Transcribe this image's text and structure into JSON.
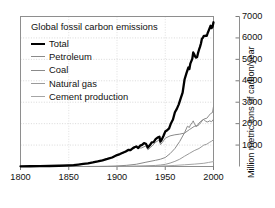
{
  "chart_data": {
    "type": "line",
    "title": "Global fossil carbon emissions",
    "xlabel": "",
    "ylabel": "Million metric tons of carbon/year",
    "xlim": [
      1800,
      2000
    ],
    "ylim": [
      0,
      7000
    ],
    "xticks": [
      1800,
      1850,
      1900,
      1950,
      2000
    ],
    "yticks": [
      1000,
      2000,
      3000,
      4000,
      5000,
      6000,
      7000
    ],
    "grid": true,
    "legend_position": "upper left",
    "legend": [
      "Total",
      "Petroleum",
      "Coal",
      "Natural gas",
      "Cement production"
    ],
    "series": [
      {
        "name": "Total",
        "color": "#000000",
        "width": 2.3,
        "x": [
          1800,
          1810,
          1820,
          1830,
          1840,
          1850,
          1855,
          1860,
          1865,
          1870,
          1875,
          1880,
          1885,
          1890,
          1895,
          1900,
          1903,
          1906,
          1909,
          1912,
          1914,
          1916,
          1918,
          1920,
          1922,
          1924,
          1926,
          1928,
          1930,
          1932,
          1934,
          1936,
          1938,
          1940,
          1942,
          1944,
          1945,
          1946,
          1948,
          1950,
          1952,
          1954,
          1956,
          1958,
          1960,
          1962,
          1964,
          1966,
          1968,
          1970,
          1972,
          1974,
          1975,
          1976,
          1978,
          1979,
          1980,
          1981,
          1982,
          1983,
          1984,
          1985,
          1986,
          1987,
          1988,
          1989,
          1990,
          1991,
          1992,
          1993,
          1994,
          1995,
          1996,
          1997,
          1998,
          1999,
          2000
        ],
        "y": [
          8,
          11,
          17,
          24,
          36,
          54,
          64,
          91,
          119,
          147,
          188,
          236,
          290,
          352,
          420,
          534,
          580,
          640,
          700,
          780,
          760,
          840,
          900,
          935,
          860,
          975,
          1010,
          1090,
          1060,
          880,
          990,
          1130,
          1140,
          1280,
          1350,
          1390,
          1160,
          1220,
          1410,
          1630,
          1690,
          1780,
          2020,
          2190,
          2530,
          2690,
          2900,
          3180,
          3450,
          4060,
          4360,
          4620,
          4550,
          4800,
          5020,
          5320,
          5240,
          5130,
          5080,
          5110,
          5300,
          5450,
          5580,
          5740,
          5960,
          6010,
          6100,
          6090,
          6110,
          6100,
          6230,
          6340,
          6450,
          6570,
          6460,
          6520,
          6730
        ]
      },
      {
        "name": "Petroleum",
        "color": "#8a8a8a",
        "width": 1.0,
        "x": [
          1870,
          1880,
          1890,
          1900,
          1910,
          1920,
          1930,
          1940,
          1945,
          1950,
          1955,
          1960,
          1965,
          1970,
          1973,
          1975,
          1976,
          1978,
          1979,
          1980,
          1982,
          1984,
          1985,
          1987,
          1989,
          1991,
          1993,
          1995,
          1997,
          1999,
          2000
        ],
        "y": [
          1,
          5,
          12,
          25,
          55,
          105,
          200,
          290,
          340,
          420,
          600,
          840,
          1170,
          1580,
          1880,
          1820,
          1930,
          2050,
          2130,
          2020,
          1870,
          1920,
          1950,
          2060,
          2180,
          2230,
          2250,
          2360,
          2470,
          2520,
          2800
        ]
      },
      {
        "name": "Coal",
        "color": "#8a8a8a",
        "width": 1.0,
        "x": [
          1800,
          1820,
          1840,
          1860,
          1880,
          1900,
          1910,
          1913,
          1918,
          1920,
          1925,
          1930,
          1932,
          1935,
          1940,
          1944,
          1945,
          1947,
          1950,
          1955,
          1960,
          1965,
          1970,
          1975,
          1980,
          1983,
          1985,
          1988,
          1990,
          1992,
          1994,
          1996,
          1998,
          2000
        ],
        "y": [
          8,
          16,
          34,
          88,
          228,
          510,
          700,
          780,
          860,
          900,
          860,
          960,
          780,
          900,
          1130,
          1250,
          1020,
          1120,
          1320,
          1430,
          1480,
          1510,
          1560,
          1720,
          1870,
          1900,
          2030,
          2150,
          2200,
          2100,
          2080,
          2130,
          2090,
          2200
        ]
      },
      {
        "name": "Natural gas",
        "color": "#9a9a9a",
        "width": 1.0,
        "x": [
          1890,
          1900,
          1910,
          1920,
          1930,
          1940,
          1945,
          1950,
          1955,
          1960,
          1965,
          1970,
          1975,
          1980,
          1985,
          1990,
          1993,
          1996,
          1998,
          2000
        ],
        "y": [
          1,
          3,
          8,
          15,
          30,
          50,
          70,
          100,
          160,
          240,
          340,
          480,
          610,
          740,
          840,
          1000,
          1040,
          1130,
          1180,
          1250
        ]
      },
      {
        "name": "Cement production",
        "color": "#a5a5a5",
        "width": 1.0,
        "x": [
          1900,
          1920,
          1940,
          1950,
          1960,
          1970,
          1980,
          1990,
          1995,
          2000
        ],
        "y": [
          5,
          12,
          20,
          30,
          50,
          80,
          110,
          150,
          190,
          230
        ]
      }
    ]
  },
  "axis": {
    "xtick_labels": [
      "1800",
      "1850",
      "1900",
      "1950",
      "2000"
    ],
    "ytick_labels": [
      "1000",
      "2000",
      "3000",
      "4000",
      "5000",
      "6000",
      "7000"
    ]
  }
}
